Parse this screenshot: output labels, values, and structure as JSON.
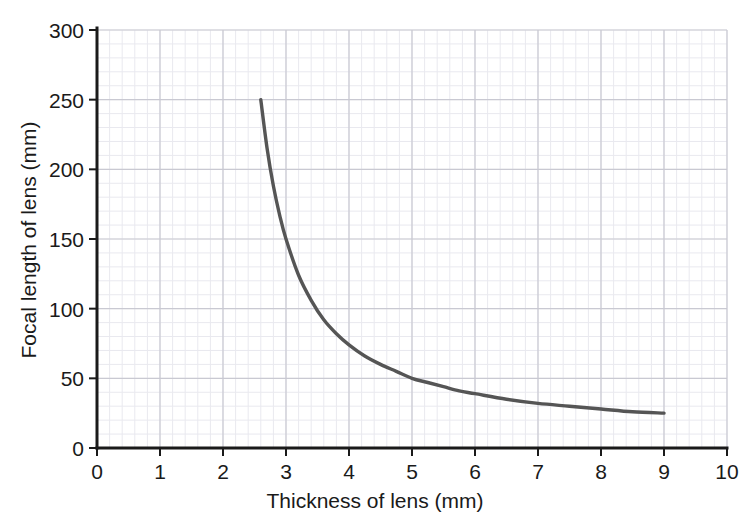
{
  "chart_data": {
    "type": "line",
    "title": "",
    "xlabel": "Thickness of lens (mm)",
    "ylabel": "Focal length of lens (mm)",
    "xlim": [
      0,
      10
    ],
    "ylim": [
      0,
      300
    ],
    "xticks": [
      0,
      1,
      2,
      3,
      4,
      5,
      6,
      7,
      8,
      9,
      10
    ],
    "yticks": [
      0,
      50,
      100,
      150,
      200,
      250,
      300
    ],
    "xtick_labels": [
      "0",
      "1",
      "2",
      "3",
      "4",
      "5",
      "6",
      "7",
      "8",
      "9",
      "10"
    ],
    "ytick_labels": [
      "0",
      "50",
      "100",
      "150",
      "200",
      "250",
      "300"
    ],
    "grid": true,
    "minor_grid": true,
    "minor_grid_step_x": 0.2,
    "minor_grid_step_y": 10,
    "legend": "none",
    "series": [
      {
        "name": "focal length vs thickness",
        "color": "#555555",
        "x": [
          2.6,
          2.7,
          2.8,
          2.9,
          3.0,
          3.2,
          3.4,
          3.6,
          3.8,
          4.0,
          4.25,
          4.5,
          4.75,
          5.0,
          5.25,
          5.5,
          5.75,
          6.0,
          6.5,
          7.0,
          7.5,
          8.0,
          8.5,
          9.0
        ],
        "y": [
          250,
          215,
          188,
          167,
          150,
          124,
          106,
          92,
          82,
          74,
          66,
          60,
          55,
          50,
          47,
          44,
          41,
          39,
          35,
          32,
          30,
          28,
          26,
          25
        ]
      }
    ]
  },
  "axis": {
    "x_title": "Thickness of lens (mm)",
    "y_title": "Focal length of lens (mm)"
  },
  "colors": {
    "curve": "#555555",
    "axis": "#1a1a1a",
    "major_grid": "#c9c9d2",
    "minor_grid": "#e9e9ef",
    "tick_text": "#1a1a1a"
  }
}
